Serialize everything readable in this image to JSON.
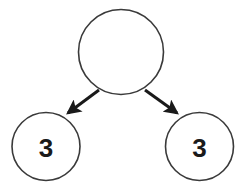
{
  "canvas": {
    "width": 240,
    "height": 191,
    "background_color": "#ffffff"
  },
  "style": {
    "node_stroke_color": "#3a3a3a",
    "node_stroke_width": 1.6,
    "node_fill_color": "#ffffff",
    "edge_color": "#1a1a1a",
    "edge_stroke_width": 3,
    "label_color": "#1a1a1a",
    "label_font_size": 26
  },
  "diagram": {
    "type": "tree",
    "title": "",
    "nodes": [
      {
        "id": "root",
        "label": "",
        "role": "parent",
        "cx": 121,
        "cy": 52,
        "r": 42.5
      },
      {
        "id": "child-left",
        "label": "3",
        "role": "leaf",
        "cx": 46,
        "cy": 146.5,
        "r": 34
      },
      {
        "id": "child-right",
        "label": "3",
        "role": "leaf",
        "cx": 199.5,
        "cy": 146.5,
        "r": 34
      }
    ],
    "edges": [
      {
        "id": "edge-root-left",
        "from": "root",
        "to": "child-left",
        "direction": "down-left",
        "arrowhead": true,
        "x1": 99,
        "y1": 90,
        "x2": 68,
        "y2": 113
      },
      {
        "id": "edge-root-right",
        "from": "root",
        "to": "child-right",
        "direction": "down-right",
        "arrowhead": true,
        "x1": 145,
        "y1": 90,
        "x2": 177,
        "y2": 113
      }
    ]
  }
}
